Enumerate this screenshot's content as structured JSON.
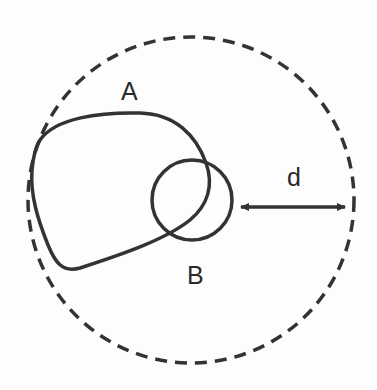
{
  "diagram": {
    "title": "",
    "colors": {
      "stroke": "#333333",
      "dashed": "#333333",
      "text": "#2a2a2a",
      "background": "#fdfdfd"
    },
    "labels": {
      "region_a": "A",
      "region_b": "B",
      "distance": "d"
    },
    "elements": [
      {
        "id": "outer-dashed-circle",
        "type": "circle",
        "style": "dashed",
        "center": [
          191,
          200
        ],
        "radius": 163
      },
      {
        "id": "region-a",
        "type": "closed-curve",
        "style": "solid",
        "label": "A"
      },
      {
        "id": "region-b",
        "type": "circle",
        "style": "solid",
        "center": [
          192,
          200
        ],
        "radius": 40,
        "label": "B"
      },
      {
        "id": "distance-arrow",
        "type": "double-arrow",
        "from": [
          239,
          207
        ],
        "to": [
          347,
          207
        ],
        "label": "d"
      }
    ]
  }
}
